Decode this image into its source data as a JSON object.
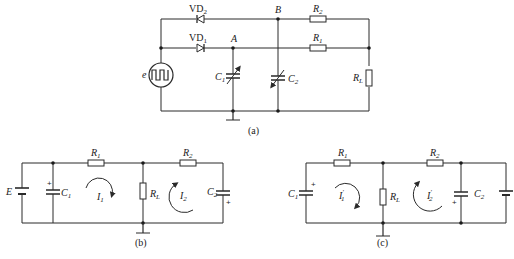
{
  "diagram_a": {
    "caption": "(a)",
    "source_label": "e",
    "diodes": [
      {
        "name": "VD",
        "sub": "2"
      },
      {
        "name": "VD",
        "sub": "1"
      }
    ],
    "nodes": {
      "a": "A",
      "b": "B"
    },
    "capacitors": [
      {
        "name": "C",
        "sub": "1"
      },
      {
        "name": "C",
        "sub": "2"
      }
    ],
    "resistors": [
      {
        "name": "R",
        "sub": "2"
      },
      {
        "name": "R",
        "sub": "1"
      },
      {
        "name": "R",
        "sub": "L"
      }
    ]
  },
  "diagram_b": {
    "caption": "(b)",
    "battery_label": "E",
    "capacitors": [
      {
        "name": "C",
        "sub": "1",
        "plus": "+"
      },
      {
        "name": "C",
        "sub": "2",
        "plus": "+"
      }
    ],
    "resistors": [
      {
        "name": "R",
        "sub": "1"
      },
      {
        "name": "R",
        "sub": "2"
      },
      {
        "name": "R",
        "sub": "L"
      }
    ],
    "loop_currents": [
      {
        "name": "I",
        "sub": "1"
      },
      {
        "name": "I",
        "sub": "2"
      }
    ]
  },
  "diagram_c": {
    "caption": "(c)",
    "capacitors": [
      {
        "name": "C",
        "sub": "1",
        "plus": "+"
      },
      {
        "name": "C",
        "sub": "2",
        "plus": "+"
      }
    ],
    "resistors": [
      {
        "name": "R",
        "sub": "1"
      },
      {
        "name": "R",
        "sub": "2"
      },
      {
        "name": "R",
        "sub": "L"
      }
    ],
    "loop_currents": [
      {
        "name": "I",
        "sup": "′",
        "sub": "1"
      },
      {
        "name": "I",
        "sup": "′",
        "sub": "2"
      }
    ]
  }
}
